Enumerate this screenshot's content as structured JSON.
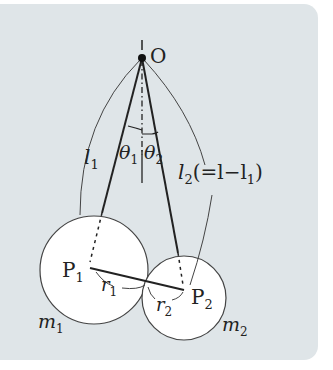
{
  "diagram": {
    "type": "double pendulum setup (two spheres suspended from point O)",
    "pivot": {
      "label": "O"
    },
    "points": [
      {
        "label": "P",
        "sub": "1"
      },
      {
        "label": "P",
        "sub": "2"
      }
    ],
    "lengths": [
      {
        "label": "l",
        "sub": "1"
      },
      {
        "label": "l",
        "sub": "2",
        "extra": "(=l−l",
        "extra_sub": "1",
        "extra_end": ")"
      }
    ],
    "angles": [
      {
        "label": "θ",
        "sub": "1"
      },
      {
        "label": "θ",
        "sub": "2"
      }
    ],
    "radii": [
      {
        "label": "r",
        "sub": "1"
      },
      {
        "label": "r",
        "sub": "2"
      }
    ],
    "masses": [
      {
        "label": "m",
        "sub": "1"
      },
      {
        "label": "m",
        "sub": "2"
      }
    ],
    "colors": {
      "background": "#dfe5e8",
      "sphere": "#ffffff",
      "line": "#222222"
    }
  }
}
